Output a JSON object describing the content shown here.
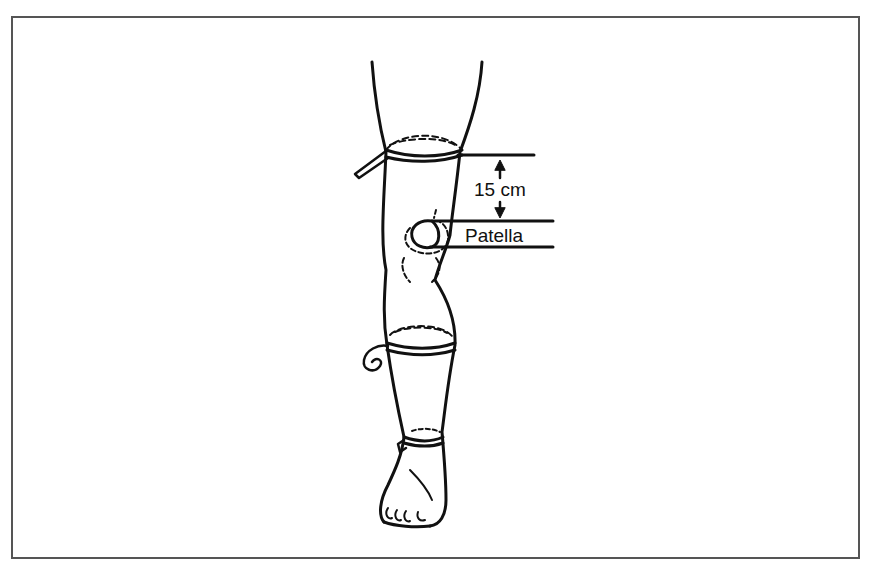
{
  "figure": {
    "labels": {
      "distance": "15 cm",
      "landmark": "Patella"
    },
    "colors": {
      "line": "#111111",
      "frame": "#555555",
      "background": "#ffffff"
    }
  }
}
